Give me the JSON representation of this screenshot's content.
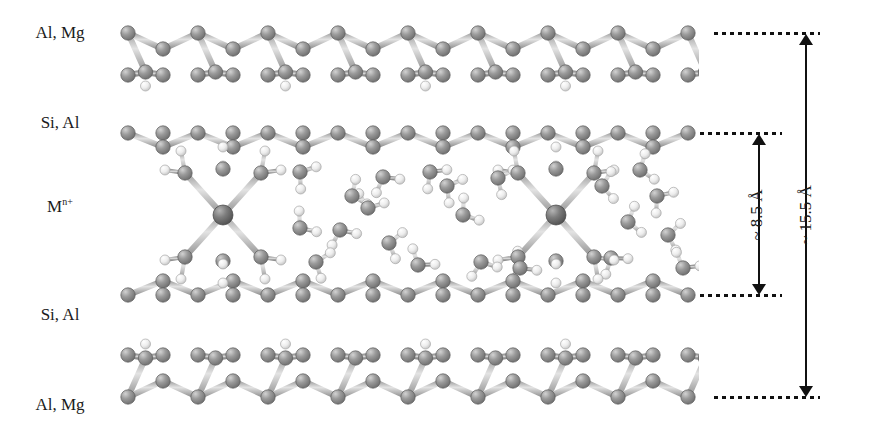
{
  "figure": {
    "type": "molecular-structure-diagram",
    "width": 869,
    "height": 431
  },
  "labels": {
    "top_octahedral": "Al, Mg",
    "top_tetrahedral": "Si, Al",
    "interlayer_cation_symbol": "M",
    "interlayer_cation_charge": "n+",
    "bottom_tetrahedral": "Si, Al",
    "bottom_octahedral": "Al, Mg"
  },
  "dimensions": {
    "interlayer": {
      "label": "~ 8.5 Å",
      "value": 8.5,
      "unit": "Å",
      "approx": true
    },
    "basal_spacing": {
      "label": "~ 15.5 Å",
      "value": 15.5,
      "unit": "Å",
      "approx": true
    }
  },
  "guide_lines": [
    {
      "name": "top-octahedral-plane",
      "y": 33
    },
    {
      "name": "top-tetrahedral-plane",
      "y": 133
    },
    {
      "name": "bottom-tetrahedral-plane",
      "y": 295
    },
    {
      "name": "bottom-octahedral-plane",
      "y": 397
    }
  ],
  "colors": {
    "atom_metal": "#6e6e6e",
    "atom_oxygen": "#8d8d8d",
    "atom_hydrogen": "#e8e8e8",
    "bond": "#b9b9b9",
    "ink": "#111111",
    "background": "#ffffff"
  },
  "atom_legend": [
    {
      "name": "metal-cation",
      "color": "#6e6e6e",
      "radius_px": 10
    },
    {
      "name": "oxygen",
      "color": "#8d8d8d",
      "radius_px": 7
    },
    {
      "name": "hydrogen",
      "color": "#e8e8e8",
      "radius_px": 5
    }
  ],
  "structure": {
    "sheet_period_px": 70,
    "sheet_x_start": 128,
    "sheet_x_end": 700,
    "hydrated_cation_count": 2,
    "hydrated_cation_coordination": 6,
    "free_water_count": 22
  }
}
